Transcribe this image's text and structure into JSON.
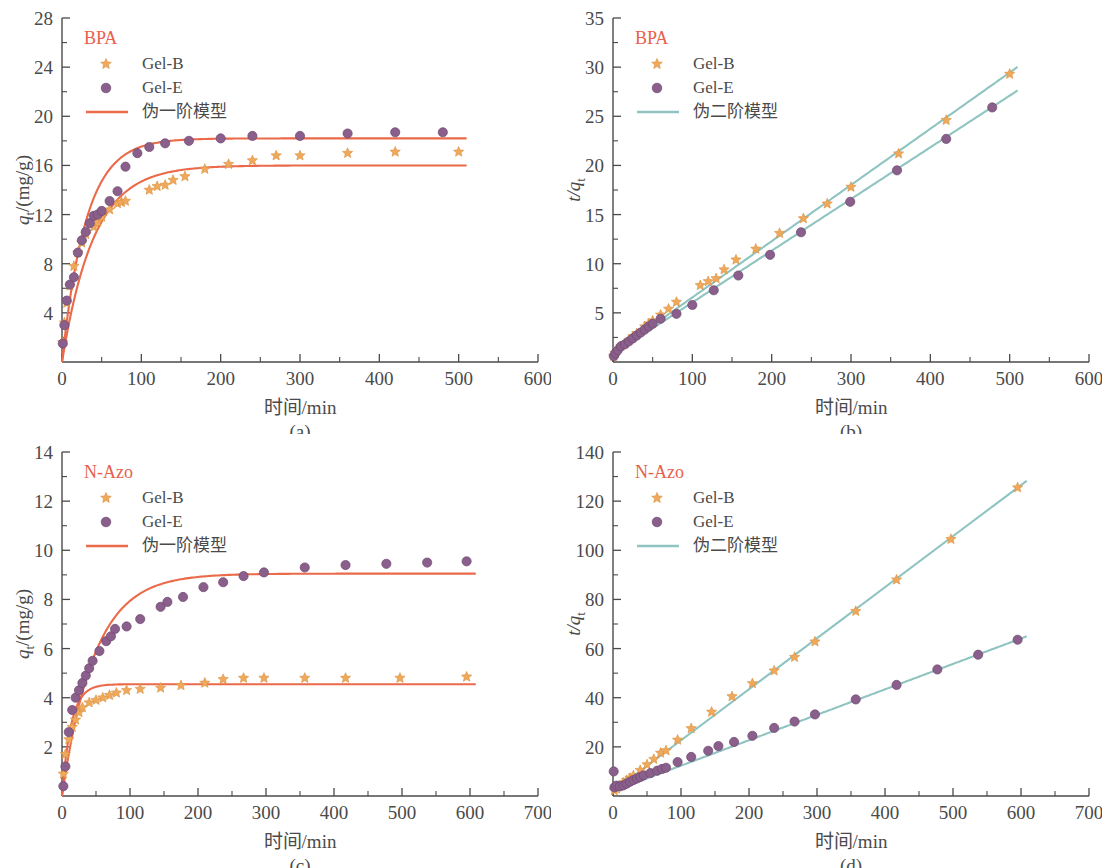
{
  "figure": {
    "panels": [
      "(a)",
      "(b)",
      "(c)",
      "(d)"
    ]
  },
  "colors": {
    "gel_b": "#f0a85a",
    "gel_e": "#8b5f8c",
    "pfo_line": "#ea6a4a",
    "pso_line": "#8fc4c0",
    "legend_title": "#e8604c",
    "axis": "#4a4a4a"
  },
  "panel_a": {
    "label": "(a)",
    "legend_title": "BPA",
    "legend": [
      {
        "name": "Gel-B",
        "marker": "star"
      },
      {
        "name": "Gel-E",
        "marker": "circle"
      },
      {
        "name": "伪一阶模型",
        "marker": "line"
      }
    ]
  },
  "panel_b": {
    "label": "(b)",
    "legend_title": "BPA",
    "legend": [
      {
        "name": "Gel-B",
        "marker": "star"
      },
      {
        "name": "Gel-E",
        "marker": "circle"
      },
      {
        "name": "伪二阶模型",
        "marker": "line"
      }
    ]
  },
  "panel_c": {
    "label": "(c)",
    "legend_title": "N-Azo",
    "legend": [
      {
        "name": "Gel-B",
        "marker": "star"
      },
      {
        "name": "Gel-E",
        "marker": "circle"
      },
      {
        "name": "伪一阶模型",
        "marker": "line"
      }
    ]
  },
  "panel_d": {
    "label": "(d)",
    "legend_title": "N-Azo",
    "legend": [
      {
        "name": "Gel-B",
        "marker": "star"
      },
      {
        "name": "Gel-E",
        "marker": "circle"
      },
      {
        "name": "伪二阶模型",
        "marker": "line"
      }
    ]
  },
  "chart_data": [
    {
      "id": "a",
      "type": "scatter",
      "title": "BPA",
      "panel_label": "(a)",
      "xlabel": "时间/min",
      "ylabel": "q_t/(mg/g)",
      "ylabel_parts": {
        "var": "q",
        "sub": "t",
        "unit": "/(mg/g)"
      },
      "xlim": [
        0,
        600
      ],
      "ylim": [
        0,
        28
      ],
      "xticks": [
        0,
        100,
        200,
        300,
        400,
        500,
        600
      ],
      "yticks": [
        4,
        8,
        12,
        16,
        20,
        24,
        28
      ],
      "x_minor_count": 1,
      "y_minor_count": 1,
      "grid": false,
      "legend_position": "top-left",
      "series": [
        {
          "name": "Gel-B",
          "marker": "star",
          "color": "#f0a85a",
          "x": [
            1,
            3,
            6,
            10,
            15,
            20,
            25,
            30,
            40,
            45,
            50,
            60,
            70,
            75,
            80,
            110,
            120,
            130,
            140,
            155,
            180,
            210,
            240,
            270,
            300,
            360,
            420,
            500
          ],
          "y": [
            1.6,
            3.2,
            4.8,
            6.2,
            7.8,
            8.9,
            9.7,
            10.4,
            11.0,
            11.4,
            11.8,
            12.4,
            12.9,
            13.0,
            13.1,
            14.0,
            14.3,
            14.4,
            14.8,
            15.1,
            15.7,
            16.1,
            16.4,
            16.8,
            16.8,
            17.0,
            17.1,
            17.1
          ]
        },
        {
          "name": "Gel-E",
          "marker": "circle",
          "color": "#8b5f8c",
          "x": [
            1,
            3,
            6,
            10,
            15,
            20,
            25,
            30,
            35,
            40,
            45,
            50,
            60,
            70,
            80,
            95,
            110,
            130,
            160,
            200,
            240,
            300,
            360,
            420,
            480
          ],
          "y": [
            1.5,
            3.0,
            5.0,
            6.3,
            6.9,
            8.9,
            9.9,
            10.6,
            11.3,
            11.9,
            12.0,
            12.3,
            13.1,
            13.9,
            15.9,
            17.0,
            17.5,
            17.8,
            18.0,
            18.2,
            18.4,
            18.4,
            18.6,
            18.7,
            18.7
          ]
        },
        {
          "name": "伪一阶模型 (Gel-B)",
          "marker": "line",
          "color": "#ea6a4a",
          "model": "pseudo-first-order",
          "qe": 16.0,
          "k1": 0.025
        },
        {
          "name": "伪一阶模型 (Gel-E)",
          "marker": "line",
          "color": "#ea6a4a",
          "model": "pseudo-first-order",
          "qe": 18.2,
          "k1": 0.033
        }
      ]
    },
    {
      "id": "b",
      "type": "scatter",
      "title": "BPA",
      "panel_label": "(b)",
      "xlabel": "时间/min",
      "ylabel": "t/q_t",
      "ylabel_parts": {
        "num": "t",
        "var": "q",
        "sub": "t"
      },
      "xlim": [
        0,
        600
      ],
      "ylim": [
        0,
        35
      ],
      "xticks": [
        0,
        100,
        200,
        300,
        400,
        500,
        600
      ],
      "yticks": [
        5,
        10,
        15,
        20,
        25,
        30,
        35
      ],
      "x_minor_count": 1,
      "y_minor_count": 1,
      "grid": false,
      "legend_position": "top-left",
      "series": [
        {
          "name": "Gel-B",
          "marker": "star",
          "color": "#f0a85a",
          "x": [
            1,
            3,
            6,
            10,
            15,
            20,
            25,
            30,
            40,
            45,
            50,
            60,
            70,
            80,
            110,
            120,
            130,
            140,
            155,
            180,
            210,
            240,
            270,
            300,
            360,
            420,
            500
          ],
          "y": [
            0.6,
            0.9,
            1.3,
            1.6,
            1.9,
            2.2,
            2.6,
            2.9,
            3.6,
            3.9,
            4.2,
            4.8,
            5.4,
            6.1,
            7.8,
            8.2,
            8.5,
            9.4,
            10.4,
            11.5,
            13.1,
            14.6,
            16.1,
            17.8,
            21.2,
            24.6,
            29.3
          ]
        },
        {
          "name": "Gel-E",
          "marker": "circle",
          "color": "#8b5f8c",
          "x": [
            1,
            3,
            6,
            10,
            15,
            20,
            25,
            30,
            35,
            40,
            45,
            50,
            60,
            80,
            100,
            127,
            158,
            198,
            237,
            299,
            358,
            420,
            478
          ],
          "y": [
            0.6,
            0.9,
            1.2,
            1.6,
            1.8,
            2.1,
            2.4,
            2.7,
            3.0,
            3.3,
            3.6,
            3.9,
            4.4,
            4.9,
            5.8,
            7.3,
            8.8,
            10.9,
            13.2,
            16.3,
            19.5,
            22.7,
            25.9
          ]
        },
        {
          "name": "伪二阶模型 (Gel-B)",
          "marker": "line",
          "color": "#8fc4c0",
          "model": "pseudo-second-order",
          "intercept": 0.85,
          "slope": 0.0572
        },
        {
          "name": "伪二阶模型 (Gel-E)",
          "marker": "line",
          "color": "#8fc4c0",
          "model": "pseudo-second-order",
          "intercept": 0.8,
          "slope": 0.0526
        }
      ]
    },
    {
      "id": "c",
      "type": "scatter",
      "title": "N-Azo",
      "panel_label": "(c)",
      "xlabel": "时间/min",
      "ylabel": "q_t/(mg/g)",
      "ylabel_parts": {
        "var": "q",
        "sub": "t",
        "unit": "/(mg/g)"
      },
      "xlim": [
        0,
        700
      ],
      "ylim": [
        0,
        14
      ],
      "xticks": [
        0,
        100,
        200,
        300,
        400,
        500,
        600,
        700
      ],
      "yticks": [
        2,
        4,
        6,
        8,
        10,
        12,
        14
      ],
      "x_minor_count": 1,
      "y_minor_count": 1,
      "grid": false,
      "legend_position": "top-left",
      "series": [
        {
          "name": "Gel-B",
          "marker": "star",
          "color": "#f0a85a",
          "x": [
            2,
            5,
            10,
            15,
            20,
            25,
            30,
            40,
            50,
            60,
            70,
            80,
            95,
            115,
            145,
            175,
            210,
            237,
            267,
            297,
            357,
            417,
            497,
            595
          ],
          "y": [
            0.9,
            1.7,
            2.3,
            2.8,
            3.1,
            3.4,
            3.6,
            3.8,
            3.9,
            4.0,
            4.1,
            4.2,
            4.3,
            4.35,
            4.4,
            4.5,
            4.6,
            4.75,
            4.8,
            4.8,
            4.8,
            4.8,
            4.8,
            4.85
          ]
        },
        {
          "name": "Gel-E",
          "marker": "circle",
          "color": "#8b5f8c",
          "x": [
            2,
            5,
            10,
            15,
            20,
            25,
            30,
            35,
            40,
            45,
            55,
            65,
            72,
            78,
            95,
            115,
            145,
            155,
            178,
            208,
            237,
            267,
            297,
            357,
            417,
            477,
            537,
            595
          ],
          "y": [
            0.4,
            1.2,
            2.6,
            3.5,
            4.0,
            4.3,
            4.6,
            4.9,
            5.2,
            5.5,
            5.9,
            6.3,
            6.5,
            6.8,
            6.9,
            7.2,
            7.7,
            7.9,
            8.1,
            8.5,
            8.7,
            8.95,
            9.1,
            9.3,
            9.4,
            9.45,
            9.5,
            9.55
          ]
        },
        {
          "name": "伪一阶模型 (Gel-B)",
          "marker": "line",
          "color": "#ea6a4a",
          "model": "pseudo-first-order",
          "qe": 4.55,
          "k1": 0.075
        },
        {
          "name": "伪一阶模型 (Gel-E)",
          "marker": "line",
          "color": "#ea6a4a",
          "model": "pseudo-first-order",
          "qe": 9.05,
          "k1": 0.021
        }
      ]
    },
    {
      "id": "d",
      "type": "scatter",
      "title": "N-Azo",
      "panel_label": "(d)",
      "xlabel": "时间/min",
      "ylabel": "t/q_t",
      "ylabel_parts": {
        "num": "t",
        "var": "q",
        "sub": "t"
      },
      "xlim": [
        0,
        700
      ],
      "ylim": [
        0,
        140
      ],
      "xticks": [
        0,
        100,
        200,
        300,
        400,
        500,
        600,
        700
      ],
      "yticks": [
        20,
        40,
        60,
        80,
        100,
        120,
        140
      ],
      "x_minor_count": 1,
      "y_minor_count": 1,
      "grid": false,
      "legend_position": "top-left",
      "series": [
        {
          "name": "Gel-B",
          "marker": "star",
          "color": "#f0a85a",
          "x": [
            2,
            5,
            10,
            15,
            20,
            25,
            30,
            40,
            50,
            60,
            70,
            78,
            95,
            115,
            145,
            175,
            205,
            237,
            267,
            297,
            357,
            417,
            497,
            595
          ],
          "y": [
            2.2,
            2.9,
            4.3,
            5.4,
            6.4,
            7.3,
            8.3,
            10.5,
            12.8,
            15.0,
            17.5,
            18.5,
            22.8,
            27.5,
            34.2,
            40.5,
            45.8,
            51.0,
            56.5,
            62.8,
            75.2,
            88.0,
            104.5,
            125.5
          ]
        },
        {
          "name": "Gel-E",
          "marker": "circle",
          "color": "#8b5f8c",
          "x": [
            1,
            2,
            5,
            10,
            15,
            20,
            25,
            30,
            35,
            40,
            45,
            55,
            65,
            72,
            78,
            95,
            115,
            140,
            155,
            178,
            205,
            237,
            267,
            297,
            357,
            417,
            477,
            537,
            595
          ],
          "y": [
            10.0,
            3.5,
            4.2,
            3.9,
            4.3,
            5.0,
            5.8,
            6.5,
            7.1,
            7.7,
            8.4,
            9.3,
            10.3,
            11.0,
            11.5,
            13.8,
            15.9,
            18.4,
            20.3,
            22.0,
            24.5,
            27.7,
            30.3,
            33.2,
            39.3,
            45.2,
            51.5,
            57.5,
            63.6
          ]
        },
        {
          "name": "伪二阶模型 (Gel-B)",
          "marker": "line",
          "color": "#8fc4c0",
          "model": "pseudo-second-order",
          "intercept": 1.9,
          "slope": 0.2077
        },
        {
          "name": "伪二阶模型 (Gel-E)",
          "marker": "line",
          "color": "#8fc4c0",
          "model": "pseudo-second-order",
          "intercept": 2.0,
          "slope": 0.1035
        }
      ]
    }
  ]
}
